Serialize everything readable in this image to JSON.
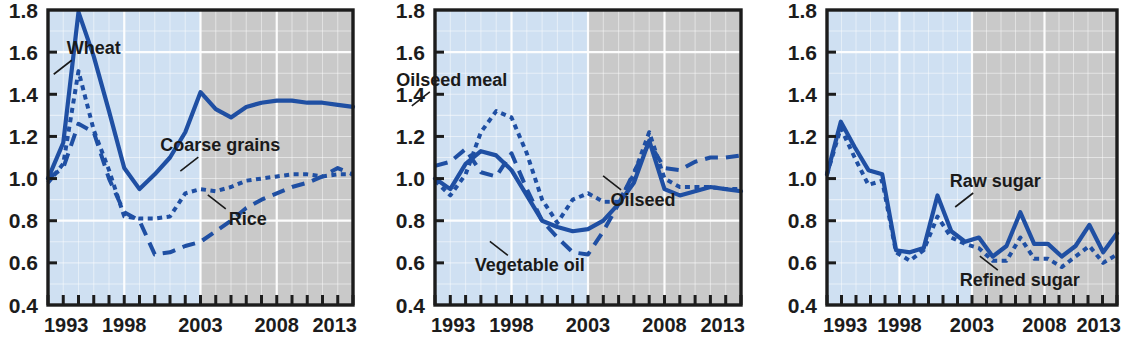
{
  "figure": {
    "panel_count": 3,
    "colors": {
      "line": "#1f4fa3",
      "historical_band": "#cfe0f2",
      "projection_band": "#c9c9c9",
      "gridline": "#ffffff",
      "axis": "#1c1c1c",
      "text": "#1a1a1a"
    },
    "axis": {
      "y_ticks": [
        "1.8",
        "1.6",
        "1.4",
        "1.2",
        "1.0",
        "0.8",
        "0.6",
        "0.4"
      ],
      "x_ticks": [
        "1993",
        "1998",
        "2003",
        "2008",
        "2013"
      ],
      "ylim": [
        0.4,
        1.8
      ],
      "xlim": [
        1993,
        2013
      ],
      "y_minor_step": 0.1,
      "x_minor_step": 1,
      "historical_end_year": 2003,
      "grid": true
    }
  },
  "chart_data": [
    {
      "type": "line",
      "panel_index": 0,
      "title": "",
      "xlabel": "",
      "ylabel": "",
      "xlim": [
        1993,
        2013
      ],
      "ylim": [
        0.4,
        1.8
      ],
      "grid": true,
      "legend_position": "inline-annotations",
      "x": [
        1993,
        1994,
        1995,
        1996,
        1997,
        1998,
        1999,
        2000,
        2001,
        2002,
        2003,
        2004,
        2005,
        2006,
        2007,
        2008,
        2009,
        2010,
        2011,
        2012,
        2013
      ],
      "series": [
        {
          "name": "Wheat",
          "style": "solid",
          "label_x": 1996.0,
          "label_y": 1.59,
          "values": [
            1.0,
            1.17,
            1.79,
            1.58,
            1.32,
            1.05,
            0.95,
            1.02,
            1.1,
            1.22,
            1.41,
            1.33,
            1.29,
            1.34,
            1.36,
            1.37,
            1.37,
            1.36,
            1.36,
            1.35,
            1.34
          ]
        },
        {
          "name": "Coarse grains",
          "style": "dotted",
          "label_x": 2004.3,
          "label_y": 1.13,
          "values": [
            0.98,
            1.07,
            1.51,
            1.23,
            1.04,
            0.82,
            0.81,
            0.81,
            0.82,
            0.93,
            0.95,
            0.94,
            0.96,
            0.99,
            1.0,
            1.01,
            1.02,
            1.02,
            1.01,
            1.02,
            1.02
          ]
        },
        {
          "name": "Rice",
          "style": "dashed",
          "label_x": 2006.1,
          "label_y": 0.78,
          "values": [
            1.0,
            1.05,
            1.26,
            1.22,
            1.0,
            0.84,
            0.8,
            0.64,
            0.65,
            0.68,
            0.7,
            0.75,
            0.8,
            0.86,
            0.9,
            0.93,
            0.96,
            0.98,
            1.01,
            1.05,
            1.02
          ]
        }
      ]
    },
    {
      "type": "line",
      "panel_index": 1,
      "title": "",
      "xlabel": "",
      "ylabel": "",
      "xlim": [
        1993,
        2013
      ],
      "ylim": [
        0.4,
        1.8
      ],
      "grid": true,
      "legend_position": "inline-annotations",
      "x": [
        1993,
        1994,
        1995,
        1996,
        1997,
        1998,
        1999,
        2000,
        2001,
        2002,
        2003,
        2004,
        2005,
        2006,
        2007,
        2008,
        2009,
        2010,
        2011,
        2012,
        2013
      ],
      "series": [
        {
          "name": "Oilseed",
          "style": "solid",
          "label_x": 2006.6,
          "label_y": 0.87,
          "values": [
            1.0,
            0.95,
            1.07,
            1.13,
            1.11,
            1.04,
            0.92,
            0.8,
            0.77,
            0.75,
            0.76,
            0.8,
            0.88,
            0.98,
            1.18,
            0.95,
            0.92,
            0.94,
            0.96,
            0.95,
            0.94
          ]
        },
        {
          "name": "Oilseed meal",
          "style": "dotted",
          "label_x": 1994.1,
          "label_y": 1.44,
          "values": [
            0.99,
            0.92,
            1.02,
            1.22,
            1.32,
            1.29,
            1.12,
            0.9,
            0.79,
            0.9,
            0.93,
            0.89,
            0.89,
            1.02,
            1.22,
            1.0,
            0.96,
            0.96,
            0.96,
            0.95,
            0.95
          ]
        },
        {
          "name": "Vegetable oil",
          "style": "dashed",
          "label_x": 1999.2,
          "label_y": 0.56,
          "values": [
            1.06,
            1.08,
            1.14,
            1.03,
            1.01,
            1.12,
            0.95,
            0.8,
            0.72,
            0.65,
            0.64,
            0.75,
            0.88,
            1.03,
            1.17,
            1.05,
            1.04,
            1.08,
            1.1,
            1.1,
            1.11
          ]
        }
      ]
    },
    {
      "type": "line",
      "panel_index": 2,
      "title": "",
      "xlabel": "",
      "ylabel": "",
      "xlim": [
        1993,
        2013
      ],
      "ylim": [
        0.4,
        1.8
      ],
      "grid": true,
      "legend_position": "inline-annotations",
      "x": [
        1993,
        1994,
        1995,
        1996,
        1997,
        1998,
        1999,
        2000,
        2001,
        2002,
        2003,
        2004,
        2005,
        2006,
        2007,
        2008,
        2009,
        2010,
        2011,
        2012,
        2013
      ],
      "series": [
        {
          "name": "Raw sugar",
          "style": "solid",
          "label_x": 2004.6,
          "label_y": 0.96,
          "values": [
            1.02,
            1.27,
            1.15,
            1.04,
            1.02,
            0.66,
            0.65,
            0.67,
            0.92,
            0.75,
            0.7,
            0.72,
            0.63,
            0.68,
            0.84,
            0.69,
            0.69,
            0.63,
            0.68,
            0.78,
            0.65,
            0.74
          ]
        },
        {
          "name": "Refined sugar",
          "style": "dotted",
          "label_x": 2006.3,
          "label_y": 0.49,
          "values": [
            1.02,
            1.24,
            1.1,
            0.97,
            0.99,
            0.65,
            0.61,
            0.66,
            0.82,
            0.72,
            0.69,
            0.67,
            0.61,
            0.61,
            0.72,
            0.62,
            0.62,
            0.58,
            0.63,
            0.68,
            0.6,
            0.64
          ]
        }
      ]
    }
  ]
}
